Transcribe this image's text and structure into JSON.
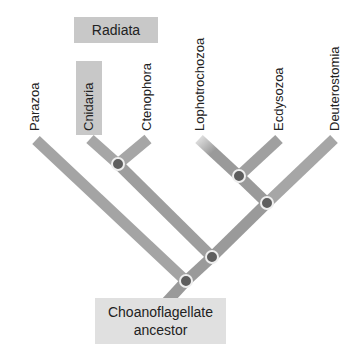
{
  "taxa": [
    {
      "label": "Parazoa"
    },
    {
      "label": "Cnidaria"
    },
    {
      "label": "Ctenophora"
    },
    {
      "label": "Lophotrochozoa"
    },
    {
      "label": "Ecdysozoa"
    },
    {
      "label": "Deuterostomia"
    }
  ],
  "groups": {
    "radiata": "Radiata"
  },
  "root": {
    "line1": "Choanoflagellate",
    "line2": "ancestor"
  },
  "colors": {
    "branch": "#9a9a9a",
    "node": "#5e5e5e",
    "node_ring": "#eeeeee",
    "label_box": "#c8c8c8",
    "root_box": "#e0e0e0"
  }
}
